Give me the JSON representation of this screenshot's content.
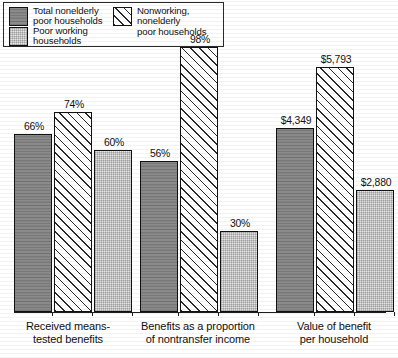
{
  "chart_data": {
    "type": "bar",
    "title": "",
    "subtitle": "",
    "xlabel": "",
    "ylabel": "",
    "grid": false,
    "legend_position": "top-left",
    "categories": [
      "Received means-\ntested benefits",
      "Benefits as a proportion\nof nontransfer income",
      "Value of benefit\nper household"
    ],
    "series": [
      {
        "name": "Total nonelderly\npoor households",
        "fill": "solid-dark-gray",
        "values": [
          66,
          56,
          4349
        ],
        "labels": [
          "66%",
          "56%",
          "$4,349"
        ]
      },
      {
        "name": "Nonworking, nonelderly\npoor households",
        "fill": "diagonal-hatch",
        "values": [
          74,
          98,
          5793
        ],
        "labels": [
          "74%",
          "98%",
          "$5,793"
        ]
      },
      {
        "name": "Poor working\nhouseholds",
        "fill": "light-dotted",
        "values": [
          60,
          30,
          2880
        ],
        "labels": [
          "60%",
          "30%",
          "$2,880"
        ]
      }
    ],
    "axis_notes": {
      "groups_1_2_units": "percent",
      "group_3_units": "dollars"
    },
    "colors": {
      "series_1": "#8a8a8a",
      "series_2": "#ffffff",
      "series_3": "#e8e8e8",
      "outline": "#111111",
      "background": "#ffffff"
    }
  },
  "legend": {
    "items": [
      {
        "label": "Total nonelderly\npoor households",
        "swatch": "solid-dark-gray"
      },
      {
        "label": "Nonworking, nonelderly\npoor households",
        "swatch": "diagonal-hatch"
      },
      {
        "label": "Poor working\nhouseholds",
        "swatch": "light-dotted"
      }
    ]
  }
}
